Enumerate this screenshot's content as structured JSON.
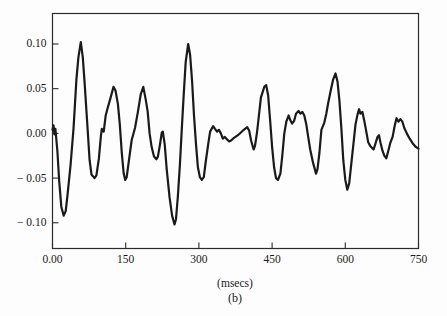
{
  "figure": {
    "background": "#fdfdfd",
    "ink": "#1a1a1a"
  },
  "chart_data": {
    "type": "line",
    "title": "",
    "xlabel": "(msecs)",
    "ylabel": "",
    "caption": "(b)",
    "xlim": [
      0,
      750
    ],
    "ylim": [
      -0.1288,
      0.1341
    ],
    "grid": false,
    "legend": false,
    "line_color": "#1a1a1a",
    "axis_color": "#2b2b2b",
    "xticks": {
      "values": [
        0,
        150,
        300,
        450,
        600,
        750
      ],
      "labels": [
        "0.00",
        "150",
        "300",
        "450",
        "600",
        "750"
      ]
    },
    "yticks": {
      "values": [
        0.1,
        0.05,
        0.0,
        -0.05,
        -0.1
      ],
      "labels": [
        "0.10",
        "0.05",
        "0.00",
        "− 0.05",
        "− 0.10"
      ]
    },
    "series": [
      {
        "name": "acoustic-waveform",
        "x": [
          0,
          2,
          4,
          6,
          10,
          14,
          18,
          23,
          27,
          31,
          37,
          43,
          49,
          53,
          58,
          62,
          66,
          72,
          76,
          80,
          86,
          90,
          95,
          99,
          101,
          105,
          109,
          113,
          119,
          125,
          129,
          134,
          138,
          142,
          146,
          149,
          152,
          156,
          162,
          169,
          175,
          181,
          186,
          191,
          195,
          199,
          203,
          208,
          213,
          216,
          220,
          224,
          226,
          230,
          234,
          240,
          245,
          250,
          253,
          257,
          261,
          265,
          269,
          273,
          278,
          282,
          286,
          290,
          294,
          298,
          302,
          306,
          310,
          314,
          319,
          323,
          329,
          333,
          337,
          341,
          345,
          349,
          353,
          358,
          362,
          366,
          372,
          380,
          386,
          392,
          399,
          403,
          407,
          412,
          415,
          419,
          423,
          427,
          434,
          438,
          442,
          446,
          450,
          454,
          458,
          462,
          467,
          471,
          475,
          479,
          484,
          487,
          491,
          495,
          499,
          504,
          508,
          512,
          516,
          520,
          524,
          528,
          534,
          540,
          543,
          547,
          551,
          554,
          557,
          561,
          565,
          571,
          575,
          580,
          584,
          588,
          592,
          596,
          600,
          604,
          608,
          612,
          617,
          621,
          625,
          628,
          631,
          635,
          639,
          643,
          647,
          651,
          658,
          662,
          666,
          669,
          672,
          676,
          680,
          684,
          688,
          692,
          697,
          701,
          705,
          709,
          713,
          717,
          721,
          726,
          732,
          738,
          744,
          750
        ],
        "y": [
          0.004,
          0.009,
          -0.001,
          0.005,
          -0.02,
          -0.055,
          -0.082,
          -0.092,
          -0.087,
          -0.068,
          -0.035,
          0.005,
          0.06,
          0.085,
          0.102,
          0.085,
          0.055,
          0.005,
          -0.03,
          -0.046,
          -0.05,
          -0.047,
          -0.028,
          -0.004,
          0.005,
          0.002,
          0.02,
          0.028,
          0.04,
          0.052,
          0.048,
          0.033,
          0.01,
          -0.022,
          -0.045,
          -0.052,
          -0.049,
          -0.033,
          -0.008,
          0.006,
          0.024,
          0.044,
          0.052,
          0.038,
          0.024,
          0.0,
          -0.015,
          -0.026,
          -0.029,
          -0.026,
          -0.013,
          0.001,
          0.002,
          -0.012,
          -0.04,
          -0.072,
          -0.092,
          -0.102,
          -0.096,
          -0.07,
          -0.035,
          0.005,
          0.045,
          0.08,
          0.1,
          0.088,
          0.058,
          0.02,
          -0.012,
          -0.038,
          -0.049,
          -0.052,
          -0.049,
          -0.032,
          -0.012,
          0.002,
          0.008,
          0.005,
          0.002,
          0.004,
          0.0,
          -0.006,
          -0.004,
          -0.007,
          -0.009,
          -0.008,
          -0.005,
          -0.002,
          0.001,
          0.004,
          0.007,
          0.003,
          -0.008,
          -0.018,
          -0.014,
          0.001,
          0.02,
          0.04,
          0.052,
          0.054,
          0.042,
          0.015,
          -0.015,
          -0.038,
          -0.05,
          -0.052,
          -0.045,
          -0.025,
          0.0,
          0.013,
          0.02,
          0.015,
          0.011,
          0.014,
          0.022,
          0.025,
          0.022,
          0.024,
          0.02,
          0.01,
          -0.004,
          -0.018,
          -0.033,
          -0.045,
          -0.04,
          -0.022,
          0.004,
          0.008,
          0.012,
          0.022,
          0.034,
          0.05,
          0.06,
          0.067,
          0.058,
          0.037,
          0.005,
          -0.03,
          -0.052,
          -0.063,
          -0.056,
          -0.035,
          -0.01,
          0.01,
          0.021,
          0.027,
          0.022,
          0.024,
          0.014,
          0.002,
          -0.01,
          -0.014,
          -0.018,
          -0.011,
          -0.004,
          -0.002,
          -0.01,
          -0.019,
          -0.025,
          -0.028,
          -0.02,
          -0.011,
          -0.004,
          0.008,
          0.017,
          0.013,
          0.016,
          0.013,
          0.006,
          0.0,
          -0.006,
          -0.011,
          -0.015,
          -0.017
        ]
      }
    ]
  }
}
